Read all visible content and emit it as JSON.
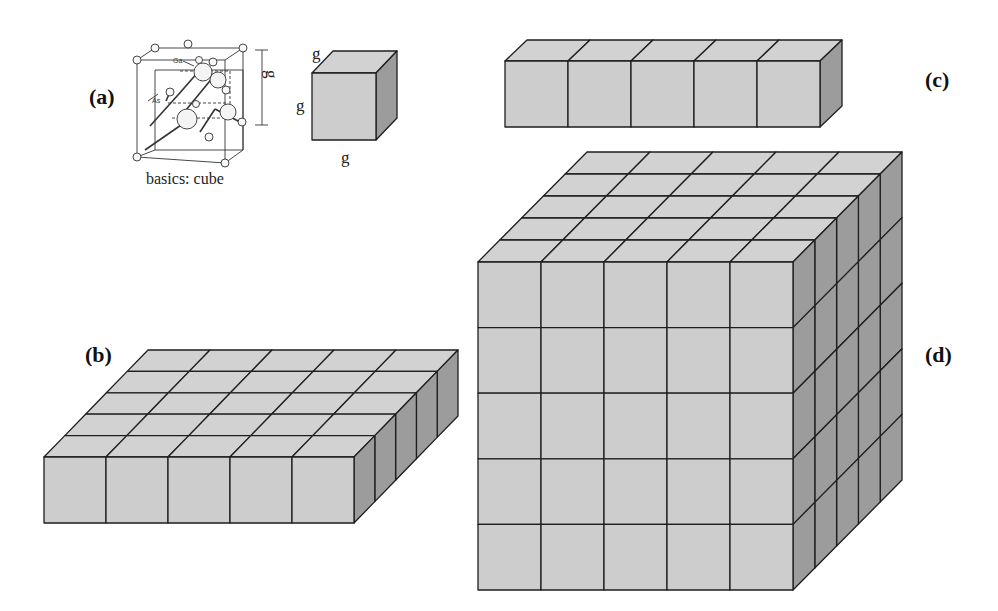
{
  "figure": {
    "colors": {
      "face": "#cdcdcd",
      "top": "#d2d2d2",
      "side": "#9c9c9c",
      "edge": "#1e1e1e",
      "background": "#ffffff"
    },
    "panels": [
      {
        "id": "a",
        "label": "(a)",
        "caption": "basics: cube",
        "description": "GaAs unit cell and single cube of edge g"
      },
      {
        "id": "b",
        "label": "(b)",
        "description": "5 x 5 x 1 slab of cubes"
      },
      {
        "id": "c",
        "label": "(c)",
        "description": "5 x 1 x 1 row of cubes"
      },
      {
        "id": "d",
        "label": "(d)",
        "description": "5 x 5 x 5 cube of cubes"
      }
    ],
    "crystal": {
      "atom_labels": [
        "Ga",
        "As"
      ],
      "dimension_label": "g"
    },
    "unit_cube": {
      "edge_labels": [
        "g",
        "g",
        "g"
      ]
    },
    "blocks": [
      {
        "id": "unit-cube",
        "x": 312,
        "y": 73,
        "cw": 64,
        "ch": 67,
        "nx": 1,
        "ny": 1,
        "nz": 1,
        "dx": 21,
        "dy": -22
      },
      {
        "id": "row-c",
        "x": 505,
        "y": 61,
        "cw": 63,
        "ch": 66,
        "nx": 5,
        "ny": 1,
        "nz": 1,
        "dx": 22,
        "dy": -21
      },
      {
        "id": "slab-b",
        "x": 44,
        "y": 457,
        "cw": 62,
        "ch": 66,
        "nx": 5,
        "ny": 1,
        "nz": 5,
        "dx": 20.8,
        "dy": -21.4
      },
      {
        "id": "cube-d",
        "x": 478,
        "y": 262,
        "cw": 63,
        "ch": 65.6,
        "nx": 5,
        "ny": 5,
        "nz": 5,
        "dx": 21.8,
        "dy": -22
      }
    ]
  }
}
